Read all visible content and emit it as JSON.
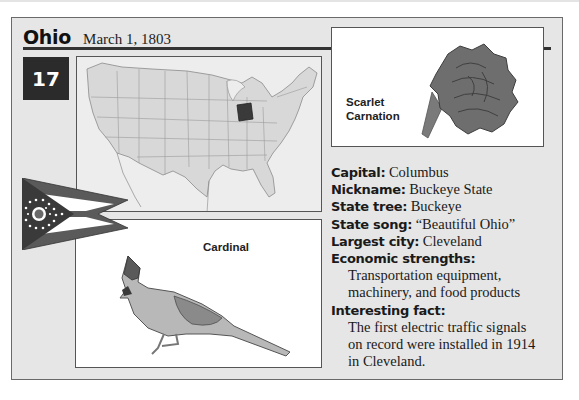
{
  "header": {
    "state_name": "Ohio",
    "statehood_date": "March 1, 1803",
    "order_number": "17"
  },
  "map": {
    "highlighted_state": "Ohio",
    "highlight_color": "#3a3a3a"
  },
  "flower": {
    "label_line1": "Scarlet",
    "label_line2": "Carnation"
  },
  "bird": {
    "label": "Cardinal"
  },
  "flag": {
    "name": "Ohio flag"
  },
  "facts": {
    "capital_label": "Capital:",
    "capital_value": "Columbus",
    "nickname_label": "Nickname:",
    "nickname_value": "Buckeye State",
    "tree_label": "State tree:",
    "tree_value": "Buckeye",
    "song_label": "State song:",
    "song_value": "“Beautiful Ohio”",
    "city_label": "Largest city:",
    "city_value": "Cleveland",
    "economy_label": "Economic strengths:",
    "economy_line1": "Transportation equipment,",
    "economy_line2": "machinery, and food products",
    "fact_label": "Interesting fact:",
    "fact_line1": "The first electric traffic signals",
    "fact_line2": "on record were installed in 1914",
    "fact_line3": "in Cleveland."
  }
}
